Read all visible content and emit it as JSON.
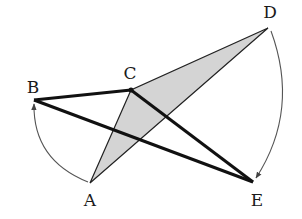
{
  "diagram": {
    "type": "geometry-rotation",
    "colors": {
      "stroke": "#111111",
      "shade": "#d4d4d4",
      "arc": "#555555"
    },
    "points": {
      "A": {
        "label": "A",
        "x": 90,
        "y": 183,
        "label_x": 90,
        "label_y": 200
      },
      "B": {
        "label": "B",
        "x": 34,
        "y": 100,
        "label_x": 33,
        "label_y": 87
      },
      "C": {
        "label": "C",
        "x": 131,
        "y": 90,
        "label_x": 130,
        "label_y": 73
      },
      "D": {
        "label": "D",
        "x": 268,
        "y": 28,
        "label_x": 270,
        "label_y": 12
      },
      "E": {
        "label": "E",
        "x": 253,
        "y": 182,
        "label_x": 257,
        "label_y": 200
      }
    },
    "shaded_triangle": [
      "A",
      "C",
      "D"
    ],
    "thick_segments": [
      [
        "B",
        "C"
      ],
      [
        "B",
        "E"
      ],
      [
        "C",
        "E"
      ]
    ],
    "thin_segments": [
      [
        "A",
        "C"
      ],
      [
        "A",
        "D"
      ],
      [
        "C",
        "D"
      ]
    ],
    "rotation_arcs": [
      {
        "from": "A",
        "to": "B",
        "direction": "counterclockwise"
      },
      {
        "from": "D",
        "to": "E",
        "direction": "clockwise"
      }
    ]
  }
}
